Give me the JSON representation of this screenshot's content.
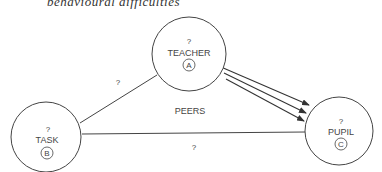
{
  "caption": "behavioural difficulties",
  "colors": {
    "stroke": "#444444",
    "text": "#444444",
    "background": "#ffffff"
  },
  "nodes": {
    "teacher": {
      "question": "?",
      "label": "TEACHER",
      "marker": "A"
    },
    "task": {
      "question": "?",
      "label": "TASK",
      "marker": "B"
    },
    "pupil": {
      "question": "?",
      "label": "PUPIL",
      "marker": "C"
    }
  },
  "edges": {
    "teacher_task": {
      "label": "?"
    },
    "task_pupil": {
      "label": "?"
    },
    "teacher_pupil": {
      "label": "",
      "arrow_count": 3
    }
  },
  "center_label": "PEERS"
}
